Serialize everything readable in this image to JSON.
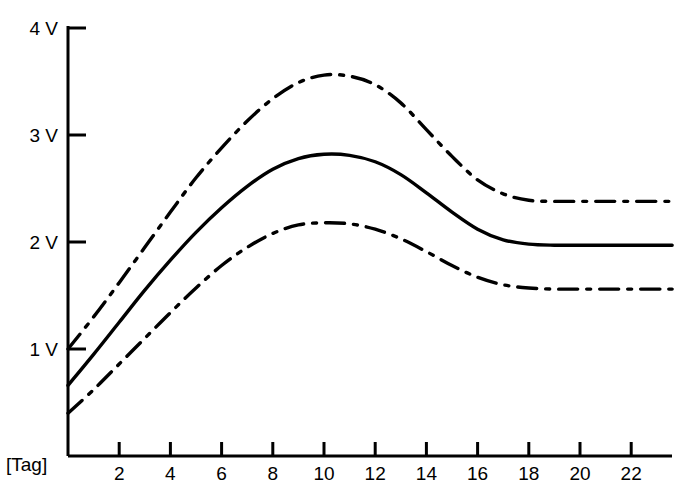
{
  "chart_data": {
    "type": "line",
    "title": "",
    "subtitle": "",
    "xlabel": "[Tag]",
    "ylabel": "",
    "xlim": [
      0,
      23.6
    ],
    "ylim": [
      0,
      4
    ],
    "grid": false,
    "legend": "none",
    "x_tick_labels": [
      "2",
      "4",
      "6",
      "8",
      "10",
      "12",
      "14",
      "16",
      "18",
      "20",
      "22"
    ],
    "x_ticks": [
      2,
      4,
      6,
      8,
      10,
      12,
      14,
      16,
      18,
      20,
      22
    ],
    "y_tick_labels": [
      "1 V",
      "2 V",
      "3 V",
      "4 V"
    ],
    "y_ticks": [
      1,
      2,
      3,
      4
    ],
    "x_unit": "Tag",
    "y_unit": "V",
    "series": [
      {
        "name": "upper-bound",
        "style": "dash-dot",
        "color": "#000000",
        "x": [
          0,
          1,
          2,
          3,
          4,
          5,
          6,
          7,
          8,
          9,
          10,
          11,
          12,
          13,
          14,
          15,
          16,
          17,
          18,
          19,
          20,
          21,
          22,
          23,
          23.6
        ],
        "values": [
          1.0,
          1.3,
          1.62,
          1.95,
          2.28,
          2.6,
          2.88,
          3.13,
          3.34,
          3.49,
          3.56,
          3.55,
          3.47,
          3.3,
          3.05,
          2.8,
          2.58,
          2.45,
          2.39,
          2.38,
          2.38,
          2.38,
          2.38,
          2.38,
          2.38
        ]
      },
      {
        "name": "mean",
        "style": "solid",
        "color": "#000000",
        "x": [
          0,
          1,
          2,
          3,
          4,
          5,
          6,
          7,
          8,
          9,
          10,
          11,
          12,
          13,
          14,
          15,
          16,
          17,
          18,
          19,
          20,
          21,
          22,
          23,
          23.6
        ],
        "values": [
          0.66,
          0.95,
          1.25,
          1.55,
          1.83,
          2.09,
          2.32,
          2.52,
          2.68,
          2.78,
          2.82,
          2.81,
          2.75,
          2.63,
          2.46,
          2.28,
          2.12,
          2.02,
          1.98,
          1.97,
          1.97,
          1.97,
          1.97,
          1.97,
          1.97
        ]
      },
      {
        "name": "lower-bound",
        "style": "dash-dot",
        "color": "#000000",
        "x": [
          0,
          1,
          2,
          3,
          4,
          5,
          6,
          7,
          8,
          9,
          10,
          11,
          12,
          13,
          14,
          15,
          16,
          17,
          18,
          19,
          20,
          21,
          22,
          23,
          23.6
        ],
        "values": [
          0.4,
          0.62,
          0.86,
          1.1,
          1.34,
          1.57,
          1.78,
          1.95,
          2.08,
          2.16,
          2.18,
          2.17,
          2.12,
          2.03,
          1.91,
          1.78,
          1.67,
          1.6,
          1.57,
          1.56,
          1.56,
          1.56,
          1.56,
          1.56,
          1.56
        ]
      }
    ],
    "annotations": [],
    "axis_color": "#000000",
    "background": "#ffffff"
  },
  "geometry": {
    "plot_left": 68,
    "plot_right": 672,
    "plot_bottom": 456,
    "plot_top": 26,
    "x_per_unit": 25.6,
    "y_per_unit": 107,
    "tick_len": 18,
    "x_tick_len": 14
  }
}
